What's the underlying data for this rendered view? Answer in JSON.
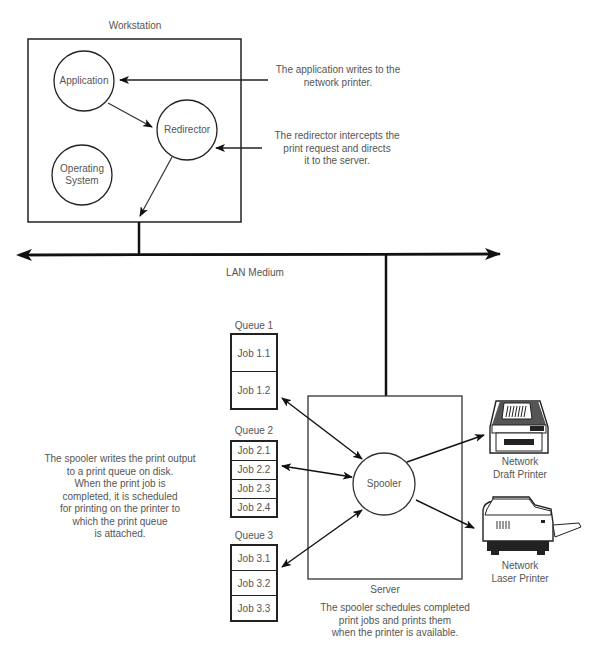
{
  "workstation": {
    "title": "Workstation",
    "components": [
      {
        "id": "application",
        "label": "Application"
      },
      {
        "id": "redirector",
        "label": "Redirector"
      },
      {
        "id": "operating-system",
        "label": "Operating\nSystem"
      }
    ]
  },
  "annotations": {
    "application_note": "The application writes to the\nnetwork printer.",
    "redirector_note": "The redirector intercepts the\nprint request and directs\nit to the server.",
    "spooler_queue_note": "The spooler writes the print output\nto a print queue on disk.\nWhen the print job is\ncompleted, it is scheduled\nfor printing on the printer to\nwhich the print queue\nis attached.",
    "spooler_schedule_note": "The spooler schedules completed\nprint jobs and prints them\nwhen the printer is available."
  },
  "network": {
    "label": "LAN Medium"
  },
  "queues": [
    {
      "title": "Queue 1",
      "jobs": [
        "Job 1.1",
        "Job 1.2"
      ]
    },
    {
      "title": "Queue 2",
      "jobs": [
        "Job 2.1",
        "Job 2.2",
        "Job 2.3",
        "Job 2.4"
      ]
    },
    {
      "title": "Queue 3",
      "jobs": [
        "Job 3.1",
        "Job 3.2",
        "Job 3.3"
      ]
    }
  ],
  "server": {
    "title": "Server",
    "spooler_label": "Spooler"
  },
  "printers": [
    {
      "id": "draft",
      "label": "Network\nDraft Printer",
      "icon": "dot-matrix-printer-icon"
    },
    {
      "id": "laser",
      "label": "Network\nLaser Printer",
      "icon": "laser-printer-icon"
    }
  ]
}
